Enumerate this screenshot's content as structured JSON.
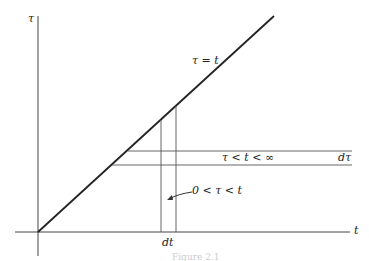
{
  "figure": {
    "axes": {
      "x_label": "t",
      "y_label": "τ"
    },
    "line_label": "τ = t",
    "strip_horizontal_label": "τ < t < ∞",
    "strip_horizontal_width_label": "dτ",
    "strip_vertical_label": "0 < τ < t",
    "strip_vertical_width_label": "dt",
    "caption": "Figure 2.1",
    "colors": {
      "line": "#222222",
      "thin": "#555555"
    }
  }
}
